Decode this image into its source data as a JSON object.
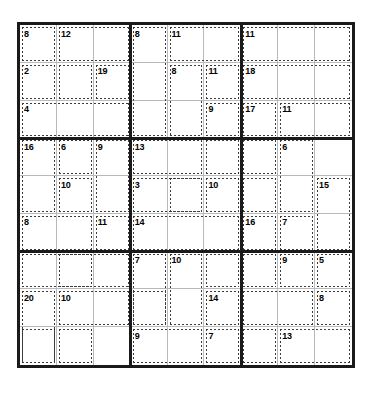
{
  "puzzle": {
    "type": "killer-sudoku",
    "grid_size": 9,
    "box_size": 3,
    "given_digits": [],
    "colors": {
      "grid_border": "#1a1a1a",
      "cell_line": "#b9b9b9",
      "cage_line": "#3a3a3a",
      "background": "#ffffff",
      "sum_text": "#000000"
    },
    "geometry": {
      "grid_left": 17,
      "grid_top": 22,
      "grid_width": 338,
      "grid_height": 346
    },
    "cages": [
      {
        "sum": "8",
        "cells": [
          [
            0,
            0
          ]
        ]
      },
      {
        "sum": "12",
        "cells": [
          [
            0,
            1
          ],
          [
            0,
            2
          ],
          [
            1,
            1
          ]
        ]
      },
      {
        "sum": "8",
        "cells": [
          [
            0,
            3
          ],
          [
            1,
            3
          ],
          [
            2,
            3
          ]
        ]
      },
      {
        "sum": "11",
        "cells": [
          [
            0,
            4
          ],
          [
            0,
            5
          ],
          [
            1,
            5
          ]
        ]
      },
      {
        "sum": "11",
        "cells": [
          [
            0,
            6
          ],
          [
            0,
            7
          ],
          [
            0,
            8
          ]
        ]
      },
      {
        "sum": "2",
        "cells": [
          [
            1,
            0
          ],
          [
            2,
            0
          ]
        ]
      },
      {
        "sum": "19",
        "cells": [
          [
            1,
            2
          ]
        ]
      },
      {
        "sum": "8",
        "cells": [
          [
            1,
            4
          ],
          [
            2,
            4
          ]
        ]
      },
      {
        "sum": "18",
        "cells": [
          [
            1,
            6
          ],
          [
            1,
            7
          ],
          [
            1,
            8
          ]
        ]
      },
      {
        "sum": "9",
        "cells": [
          [
            2,
            5
          ]
        ]
      },
      {
        "sum": "17",
        "cells": [
          [
            2,
            6
          ]
        ]
      },
      {
        "sum": "11",
        "cells": [
          [
            2,
            7
          ],
          [
            2,
            8
          ]
        ]
      },
      {
        "sum": "4",
        "cells": [
          [
            2,
            1
          ],
          [
            2,
            2
          ]
        ]
      },
      {
        "sum": "16",
        "cells": [
          [
            3,
            0
          ],
          [
            4,
            0
          ],
          [
            5,
            0
          ]
        ]
      },
      {
        "sum": "6",
        "cells": [
          [
            3,
            1
          ]
        ]
      },
      {
        "sum": "9",
        "cells": [
          [
            3,
            2
          ],
          [
            4,
            2
          ]
        ]
      },
      {
        "sum": "10",
        "cells": [
          [
            4,
            1
          ],
          [
            5,
            1
          ]
        ]
      },
      {
        "sum": "8",
        "cells": [
          [
            5,
            0
          ],
          [
            5,
            1
          ]
        ]
      },
      {
        "sum": "11",
        "cells": [
          [
            5,
            2
          ]
        ]
      },
      {
        "sum": "13",
        "cells": [
          [
            3,
            3
          ],
          [
            3,
            4
          ],
          [
            4,
            3
          ]
        ]
      },
      {
        "sum": "3",
        "cells": [
          [
            4,
            4
          ]
        ]
      },
      {
        "sum": "10",
        "cells": [
          [
            4,
            5
          ],
          [
            3,
            5
          ]
        ]
      },
      {
        "sum": "14",
        "cells": [
          [
            5,
            3
          ],
          [
            5,
            4
          ]
        ]
      },
      {
        "sum": "6",
        "cells": [
          [
            3,
            7
          ],
          [
            3,
            8
          ],
          [
            4,
            7
          ]
        ]
      },
      {
        "sum": "15",
        "cells": [
          [
            4,
            8
          ],
          [
            5,
            8
          ]
        ]
      },
      {
        "sum": "16",
        "cells": [
          [
            5,
            6
          ]
        ]
      },
      {
        "sum": "7",
        "cells": [
          [
            5,
            7
          ]
        ]
      },
      {
        "sum": "7",
        "cells": [
          [
            6,
            3
          ],
          [
            6,
            4
          ]
        ]
      },
      {
        "sum": "10",
        "cells": [
          [
            6,
            4
          ],
          [
            6,
            5
          ]
        ]
      },
      {
        "sum": "14",
        "cells": [
          [
            7,
            5
          ]
        ]
      },
      {
        "sum": "9",
        "cells": [
          [
            8,
            3
          ],
          [
            8,
            4
          ]
        ]
      },
      {
        "sum": "7",
        "cells": [
          [
            8,
            5
          ]
        ]
      },
      {
        "sum": "20",
        "cells": [
          [
            7,
            0
          ],
          [
            8,
            0
          ],
          [
            8,
            1
          ]
        ]
      },
      {
        "sum": "10",
        "cells": [
          [
            7,
            1
          ],
          [
            7,
            2
          ]
        ]
      },
      {
        "sum": "9",
        "cells": [
          [
            6,
            7
          ]
        ]
      },
      {
        "sum": "5",
        "cells": [
          [
            6,
            8
          ]
        ]
      },
      {
        "sum": "8",
        "cells": [
          [
            7,
            8
          ]
        ]
      },
      {
        "sum": "13",
        "cells": [
          [
            8,
            7
          ],
          [
            8,
            8
          ]
        ]
      }
    ],
    "cage_rects": [
      {
        "sum": "8",
        "r": 0,
        "c": 0,
        "rs": 1,
        "cs": 1
      },
      {
        "sum": "12",
        "r": 0,
        "c": 1,
        "rs": 1,
        "cs": 2
      },
      {
        "sum": "12b",
        "sum_hidden": true,
        "r": 1,
        "c": 1,
        "rs": 1,
        "cs": 1
      },
      {
        "sum": "8",
        "r": 0,
        "c": 3,
        "rs": 3,
        "cs": 1
      },
      {
        "sum": "11",
        "r": 0,
        "c": 4,
        "rs": 1,
        "cs": 2
      },
      {
        "sum": "11",
        "r": 0,
        "c": 6,
        "rs": 1,
        "cs": 3
      },
      {
        "sum": "2",
        "r": 1,
        "c": 0,
        "rs": 1,
        "cs": 1
      },
      {
        "sum": "19",
        "r": 1,
        "c": 2,
        "rs": 1,
        "cs": 1
      },
      {
        "sum": "8",
        "r": 1,
        "c": 4,
        "rs": 2,
        "cs": 1
      },
      {
        "sum": "11",
        "r": 1,
        "c": 5,
        "rs": 1,
        "cs": 1
      },
      {
        "sum": "18",
        "r": 1,
        "c": 6,
        "rs": 1,
        "cs": 3
      },
      {
        "sum": "4",
        "r": 2,
        "c": 0,
        "rs": 1,
        "cs": 3
      },
      {
        "sum": "9",
        "r": 2,
        "c": 5,
        "rs": 1,
        "cs": 1
      },
      {
        "sum": "17",
        "r": 2,
        "c": 6,
        "rs": 1,
        "cs": 1
      },
      {
        "sum": "11",
        "r": 2,
        "c": 7,
        "rs": 1,
        "cs": 2
      },
      {
        "sum": "16",
        "r": 3,
        "c": 0,
        "rs": 2,
        "cs": 1
      },
      {
        "sum": "6",
        "r": 3,
        "c": 1,
        "rs": 1,
        "cs": 1
      },
      {
        "sum": "9",
        "r": 3,
        "c": 2,
        "rs": 2,
        "cs": 1
      },
      {
        "sum": "10",
        "r": 4,
        "c": 1,
        "rs": 1,
        "cs": 1
      },
      {
        "sum": "8",
        "r": 5,
        "c": 0,
        "rs": 1,
        "cs": 2
      },
      {
        "sum": "11",
        "r": 5,
        "c": 2,
        "rs": 1,
        "cs": 1
      },
      {
        "sum": "13",
        "r": 3,
        "c": 3,
        "rs": 1,
        "cs": 2
      },
      {
        "sum": "3",
        "r": 4,
        "c": 3,
        "rs": 1,
        "cs": 2
      },
      {
        "sum": "10",
        "r": 4,
        "c": 5,
        "rs": 1,
        "cs": 1
      },
      {
        "sum": "14",
        "r": 5,
        "c": 3,
        "rs": 1,
        "cs": 3
      },
      {
        "sum": "6",
        "r": 3,
        "c": 7,
        "rs": 2,
        "cs": 1
      },
      {
        "sum": "15",
        "r": 4,
        "c": 8,
        "rs": 2,
        "cs": 1
      },
      {
        "sum": "16",
        "r": 5,
        "c": 6,
        "rs": 1,
        "cs": 1
      },
      {
        "sum": "7",
        "r": 5,
        "c": 7,
        "rs": 1,
        "cs": 1
      },
      {
        "sum": "7",
        "r": 6,
        "c": 3,
        "rs": 2,
        "cs": 1
      },
      {
        "sum": "10",
        "r": 6,
        "c": 4,
        "rs": 2,
        "cs": 1
      },
      {
        "sum": "14",
        "r": 7,
        "c": 5,
        "rs": 1,
        "cs": 1
      },
      {
        "sum": "9",
        "r": 8,
        "c": 3,
        "rs": 1,
        "cs": 2
      },
      {
        "sum": "7",
        "r": 8,
        "c": 5,
        "rs": 1,
        "cs": 1
      },
      {
        "sum": "20",
        "r": 7,
        "c": 0,
        "rs": 2,
        "cs": 1
      },
      {
        "sum": "10",
        "r": 7,
        "c": 1,
        "rs": 1,
        "cs": 2
      },
      {
        "sum": "9",
        "r": 6,
        "c": 7,
        "rs": 1,
        "cs": 1
      },
      {
        "sum": "5",
        "r": 6,
        "c": 8,
        "rs": 1,
        "cs": 1
      },
      {
        "sum": "8",
        "r": 7,
        "c": 8,
        "rs": 1,
        "cs": 1
      },
      {
        "sum": "13",
        "r": 8,
        "c": 7,
        "rs": 1,
        "cs": 2
      }
    ],
    "extra_cage_rects": [
      {
        "sum": "",
        "r": 1,
        "c": 1,
        "rs": 1,
        "cs": 1
      },
      {
        "sum": "",
        "r": 6,
        "c": 5,
        "rs": 1,
        "cs": 1
      },
      {
        "sum": "",
        "r": 8,
        "c": 1,
        "rs": 1,
        "cs": 1
      },
      {
        "sum": "",
        "r": 8,
        "c": 0,
        "rs": 1,
        "cs": 1
      },
      {
        "sum": "",
        "r": 6,
        "c": 0,
        "rs": 1,
        "cs": 3
      },
      {
        "sum": "",
        "r": 3,
        "c": 5,
        "rs": 1,
        "cs": 1
      },
      {
        "sum": "",
        "r": 3,
        "c": 6,
        "rs": 1,
        "cs": 1
      },
      {
        "sum": "",
        "r": 4,
        "c": 6,
        "rs": 1,
        "cs": 1
      },
      {
        "sum": "",
        "r": 6,
        "c": 6,
        "rs": 1,
        "cs": 1
      },
      {
        "sum": "",
        "r": 7,
        "c": 6,
        "rs": 1,
        "cs": 2
      },
      {
        "sum": "",
        "r": 8,
        "c": 6,
        "rs": 1,
        "cs": 1
      },
      {
        "sum": "",
        "r": 6,
        "c": 1,
        "rs": 1,
        "cs": 1
      },
      {
        "sum": "",
        "r": 7,
        "c": 3,
        "rs": 1,
        "cs": 1
      },
      {
        "sum": "",
        "r": 4,
        "c": 4,
        "rs": 1,
        "cs": 1
      }
    ]
  }
}
